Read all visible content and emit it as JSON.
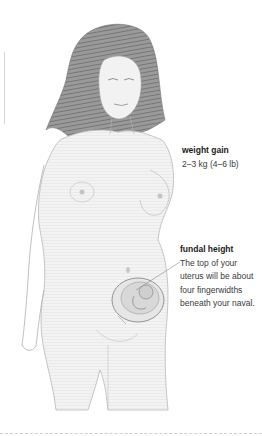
{
  "figure": {
    "style": "pencil sketch, grayscale"
  },
  "annotations": {
    "weight_gain": {
      "title": "weight gain",
      "body": "2–3 kg (4–6 lb)"
    },
    "fundal_height": {
      "title": "fundal height",
      "body": "The top of your uterus will be about four fingerwidths beneath your naval."
    }
  },
  "colors": {
    "sketch_dark": "#6e6e6e",
    "sketch_mid": "#a8a8a8",
    "sketch_light": "#e4e4e4",
    "text": "#2a2a2a"
  }
}
